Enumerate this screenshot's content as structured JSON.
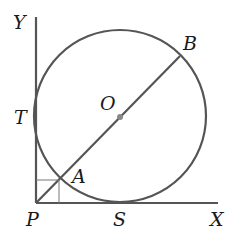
{
  "diagram": {
    "colors": {
      "stroke": "#555555",
      "center_dot": "#888888",
      "label": "#1a1a1a",
      "background": "#ffffff"
    },
    "labels": {
      "Y": "Y",
      "T": "T",
      "O": "O",
      "B": "B",
      "A": "A",
      "P": "P",
      "S": "S",
      "X": "X"
    },
    "points": {
      "P": [
        36,
        203
      ],
      "O": [
        120,
        117
      ],
      "A": [
        60,
        179
      ],
      "B": [
        180,
        56
      ],
      "S": [
        120,
        203
      ],
      "T": [
        36,
        117
      ]
    },
    "circle": {
      "cx": 120,
      "cy": 116,
      "r": 86
    },
    "axes": {
      "y_axis": {
        "x": 36,
        "y_top": 17,
        "y_bottom": 203
      },
      "x_axis": {
        "y": 203,
        "x_left": 36,
        "x_right": 218
      }
    }
  }
}
